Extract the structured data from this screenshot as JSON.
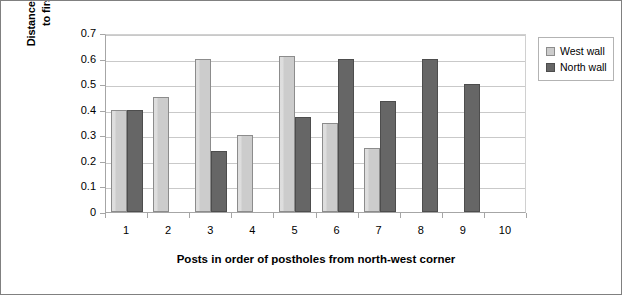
{
  "chart_data": {
    "type": "bar",
    "title": "",
    "xlabel": "Posts in order of postholes from north-west corner",
    "ylabel_line1": "Distance from bottom of post",
    "ylabel_line2": "to first joint in metres",
    "categories": [
      "1",
      "2",
      "3",
      "4",
      "5",
      "6",
      "7",
      "8",
      "9",
      "10"
    ],
    "ylim": [
      0,
      0.7
    ],
    "ytick_labels": [
      "0",
      "0.1",
      "0.2",
      "0.3",
      "0.4",
      "0.5",
      "0.6",
      "0.7"
    ],
    "ytick_values": [
      0,
      0.1,
      0.2,
      0.3,
      0.4,
      0.5,
      0.6,
      0.7
    ],
    "grid": true,
    "legend_position": "right",
    "series": [
      {
        "name": "West wall",
        "color": "#cccccc",
        "values": [
          0.4,
          0.45,
          0.6,
          0.3,
          0.61,
          0.35,
          0.25,
          null,
          null,
          null
        ]
      },
      {
        "name": "North wall",
        "color": "#666666",
        "values": [
          0.4,
          null,
          0.24,
          null,
          0.37,
          0.6,
          0.435,
          0.6,
          0.5,
          null
        ]
      }
    ]
  }
}
